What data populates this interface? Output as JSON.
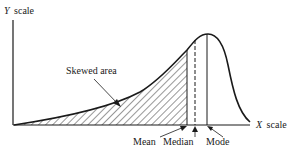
{
  "diagram": {
    "type": "negatively skewed distribution curve",
    "y_axis_label_var": "Y",
    "y_axis_label_word": "scale",
    "x_axis_label_var": "X",
    "x_axis_label_word": "scale",
    "skewed_area_label": "Skewed area",
    "markers": [
      {
        "name": "Mean",
        "style": "solid"
      },
      {
        "name": "Median",
        "style": "dashed"
      },
      {
        "name": "Mode",
        "style": "solid"
      }
    ],
    "colors": {
      "ink": "#1a1a1a",
      "background": "#ffffff"
    }
  }
}
